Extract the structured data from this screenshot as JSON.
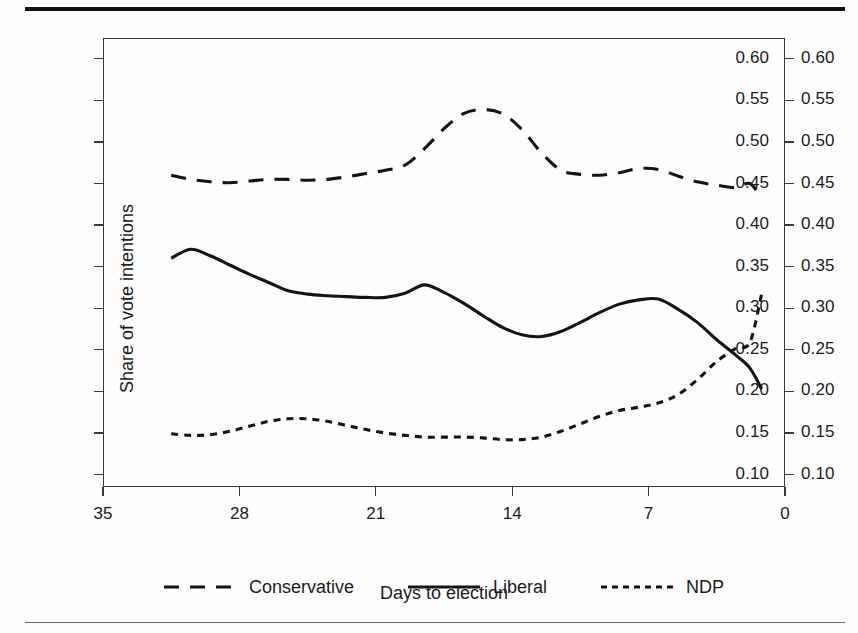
{
  "figure": {
    "background": "#fefefe",
    "rule_color": "#111111",
    "line_color": "#141414"
  },
  "chart_data": {
    "type": "line",
    "title": "",
    "xlabel": "Days to election",
    "ylabel": "Share of vote intentions",
    "xlim": [
      35,
      0
    ],
    "ylim": [
      0.085,
      0.625
    ],
    "x_reversed": true,
    "grid": false,
    "axis": {
      "x_ticks": [
        35,
        28,
        21,
        14,
        7,
        0
      ],
      "x_tick_labels": [
        "35",
        "28",
        "21",
        "14",
        "7",
        "0"
      ],
      "y_ticks": [
        0.1,
        0.15,
        0.2,
        0.25,
        0.3,
        0.35,
        0.4,
        0.45,
        0.5,
        0.55,
        0.6
      ],
      "y_tick_labels": [
        "0.10",
        "0.15",
        "0.20",
        "0.25",
        "0.30",
        "0.35",
        "0.40",
        "0.45",
        "0.50",
        "0.55",
        "0.60"
      ],
      "y_axis_duplicated_right": true
    },
    "legend": {
      "position": "below-axes",
      "entries": [
        {
          "name": "Conservative",
          "style": "dashed-long"
        },
        {
          "name": "Liberal",
          "style": "solid"
        },
        {
          "name": "NDP",
          "style": "dashed-short"
        }
      ]
    },
    "x": [
      31.5,
      30.5,
      29.5,
      28.5,
      27.5,
      26.5,
      25.5,
      24.5,
      23.5,
      22.5,
      21.5,
      20.5,
      19.5,
      18.5,
      17.5,
      16.5,
      15.5,
      14.5,
      13.5,
      12.5,
      11.5,
      10.5,
      9.5,
      8.5,
      7.5,
      6.5,
      5.5,
      4.5,
      3.5,
      2.5,
      1.5,
      1.0
    ],
    "series": [
      {
        "name": "Conservative",
        "style": "dashed-long",
        "values": [
          0.46,
          0.455,
          0.452,
          0.451,
          0.453,
          0.455,
          0.455,
          0.454,
          0.455,
          0.458,
          0.462,
          0.466,
          0.472,
          0.492,
          0.516,
          0.534,
          0.539,
          0.534,
          0.515,
          0.487,
          0.466,
          0.461,
          0.46,
          0.463,
          0.468,
          0.467,
          0.459,
          0.452,
          0.448,
          0.445,
          0.446,
          0.452
        ]
      },
      {
        "name": "Liberal",
        "style": "solid",
        "values": [
          0.36,
          0.371,
          0.363,
          0.352,
          0.341,
          0.331,
          0.321,
          0.317,
          0.315,
          0.314,
          0.313,
          0.313,
          0.318,
          0.328,
          0.319,
          0.306,
          0.291,
          0.277,
          0.268,
          0.266,
          0.272,
          0.283,
          0.295,
          0.305,
          0.31,
          0.311,
          0.311,
          0.309,
          0.305,
          0.299,
          0.291,
          0.283
        ]
      },
      {
        "name": "NDP",
        "style": "dashed-short",
        "values": [
          0.149,
          0.147,
          0.148,
          0.152,
          0.158,
          0.164,
          0.167,
          0.167,
          0.164,
          0.159,
          0.154,
          0.15,
          0.147,
          0.145,
          0.145,
          0.145,
          0.144,
          0.142,
          0.142,
          0.145,
          0.152,
          0.161,
          0.17,
          0.177,
          0.181,
          0.184,
          0.186,
          0.189,
          0.193,
          0.197,
          0.2,
          0.203
        ]
      }
    ],
    "series_tail": {
      "note": "values continue to day 1",
      "x": [
        6.5,
        5.5,
        4.5,
        3.5,
        2.5,
        1.8,
        1.2
      ],
      "Conservative": [
        0.467,
        0.459,
        0.452,
        0.448,
        0.445,
        0.45,
        0.432
      ],
      "Liberal": [
        0.311,
        0.299,
        0.283,
        0.262,
        0.243,
        0.228,
        0.203
      ],
      "NDP": [
        0.186,
        0.196,
        0.214,
        0.236,
        0.252,
        0.259,
        0.317
      ]
    },
    "polyline_points": {
      "Conservative": "M 70,147 L 86,152 L 102,156 L 118,157 L 135,156 L 152,155 L 170,155 L 188,156 L 206,155 L 224,153 L 242,150 L 258,147 L 272,143 L 288,128 L 304,108 L 318,90 L 330,82 L 342,80 L 354,88 L 366,110 L 380,134 L 396,147 L 412,150 L 428,150 L 444,146 L 460,141 L 476,140 L 492,143 L 508,148 L 524,152 L 540,155 L 556,156 L 572,152 L 588,142 L 604,136 L 620,133 L 634,134 L 646,142 L 654,156 L 660,183",
      "Liberal": "M 70,317 L 86,299 L 102,312 L 118,330 L 134,349 L 150,366 L 166,382 L 182,389 L 198,392 L 214,394 L 230,395 L 246,396 L 262,387 L 278,371 L 292,385 L 306,406 L 320,431 L 334,454 L 346,470 L 358,474 L 372,464 L 386,446 L 400,426 L 414,409 L 428,400 L 444,397 L 460,396 L 476,399 L 492,406 L 508,416 L 524,429 L 540,444 L 556,460 L 572,480 L 588,504 L 604,525 L 620,540 L 636,550 L 652,556 L 660,559",
      "NDP": "M 70,676 L 88,680 L 104,677 L 120,670 L 136,660 L 152,650 L 166,645 L 182,645 L 198,650 L 214,659 L 230,666 L 244,673 L 258,678 L 274,681 L 290,681 L 306,682 L 322,684 L 338,687 L 354,687 L 370,682 L 386,670 L 402,655 L 418,640 L 432,628 L 446,621 L 460,616 L 474,612 L 488,607 L 502,600 L 516,590 L 530,576 L 544,557 L 558,538 L 572,520 L 586,508 L 600,503 L 614,503 L 628,499 L 640,486 L 650,462 L 658,424 L 662,392"
    }
  }
}
